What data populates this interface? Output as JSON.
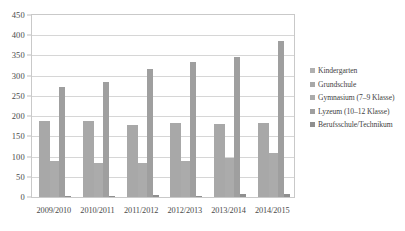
{
  "chart_data": {
    "type": "bar",
    "title": "",
    "subtitle": "",
    "xlabel": "",
    "ylabel": "",
    "ylim": [
      0,
      450
    ],
    "ytick_step": 50,
    "yticks": [
      0,
      50,
      100,
      150,
      200,
      250,
      300,
      350,
      400,
      450
    ],
    "grid": true,
    "legend_position": "right",
    "categories": [
      "2009/2010",
      "2010/2011",
      "2011/2012",
      "2012/2013",
      "2013/2014",
      "2014/2015"
    ],
    "series": [
      {
        "name": "Kindergarten",
        "color": "#b0b0b0",
        "values": [
          0,
          0,
          0,
          0,
          0,
          0
        ]
      },
      {
        "name": "Grundschule",
        "color": "#a8a8a8",
        "values": [
          188,
          187,
          179,
          184,
          181,
          182
        ]
      },
      {
        "name": "Gymnasium (7–9 Klasse)",
        "color": "#ababab",
        "values": [
          88,
          85,
          85,
          88,
          97,
          110
        ]
      },
      {
        "name": "Lyzeum (10–12 Klasse)",
        "color": "#9f9f9f",
        "values": [
          272,
          285,
          316,
          333,
          345,
          385
        ]
      },
      {
        "name": "Berufsschule/Technikum",
        "color": "#8f8f8f",
        "values": [
          2,
          2,
          6,
          3,
          7,
          8
        ]
      }
    ]
  },
  "legend": {
    "items": [
      {
        "label": "Kindergarten"
      },
      {
        "label": "Grundschule"
      },
      {
        "label": "Gymnasium (7–9 Klasse)"
      },
      {
        "label": "Lyzeum (10–12 Klasse)"
      },
      {
        "label": "Berufsschule/Technikum"
      }
    ]
  },
  "colors": {
    "plot_border": "#c9c9c9",
    "gridline": "#d6d6d6",
    "text": "#3f3f3f",
    "background": "#ffffff"
  }
}
